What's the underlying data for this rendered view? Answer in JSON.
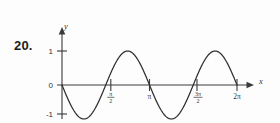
{
  "problem": {
    "number_label": "20."
  },
  "chart_data": {
    "type": "line",
    "title": "",
    "subtitle": "",
    "xlabel": "x",
    "ylabel": "y",
    "function": "y = -sin(2x)",
    "xlim": [
      0,
      6.2832
    ],
    "ylim": [
      -1,
      1
    ],
    "grid": false,
    "legend": null,
    "x_ticks": [
      {
        "value": 1.5708,
        "label": "π/2",
        "display": "fraction",
        "numerator": "π",
        "denominator": "2"
      },
      {
        "value": 3.1416,
        "label": "π",
        "display": "plain"
      },
      {
        "value": 4.7124,
        "label": "3π/2",
        "display": "fraction",
        "numerator": "3π",
        "denominator": "2"
      },
      {
        "value": 6.2832,
        "label": "2π",
        "display": "plain"
      }
    ],
    "y_ticks": [
      {
        "value": 1,
        "label": "1"
      },
      {
        "value": 0,
        "label": "0"
      },
      {
        "value": -1,
        "label": "-1"
      }
    ],
    "series": [
      {
        "name": "y = -sin(2x)",
        "color": "#2e2e2e",
        "x": [
          0,
          0.3927,
          0.7854,
          1.1781,
          1.5708,
          1.9635,
          2.3562,
          2.7489,
          3.1416,
          3.5343,
          3.927,
          4.3197,
          4.7124,
          5.1051,
          5.4978,
          5.8905,
          6.2832
        ],
        "values": [
          0,
          -0.7071,
          -1,
          -0.7071,
          0,
          0.7071,
          1,
          0.7071,
          0,
          -0.7071,
          -1,
          -0.7071,
          0,
          0.7071,
          1,
          0.7071,
          0
        ]
      }
    ],
    "key_points": {
      "zeros": [
        0,
        1.5708,
        3.1416,
        4.7124,
        6.2832
      ],
      "minima": [
        0.7854,
        3.927
      ],
      "maxima": [
        2.3562,
        5.4978
      ],
      "amplitude": 1,
      "period": 3.1416
    },
    "axis_arrows": {
      "x_positive": true,
      "y_positive": true
    }
  },
  "colors": {
    "background": "#fdfdfd",
    "axis": "#3a3a3a",
    "curve": "#2e2e2e",
    "text": "#333333",
    "number_label": "#1c1c1c"
  }
}
